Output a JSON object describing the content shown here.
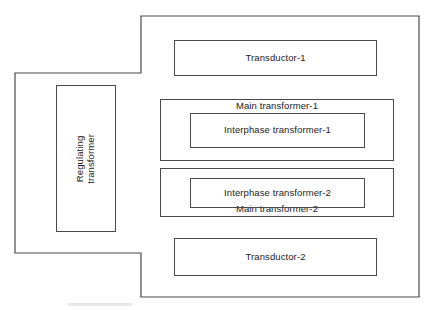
{
  "diagram": {
    "type": "block-diagram",
    "background_color": "#ffffff",
    "line_color": "#4a4a4a",
    "text_color": "#1a1a1a",
    "enclosure": {
      "name": "outer-enclosure",
      "shape": "stepped-polygon",
      "points": "141,16 419,16 419,297 141,297 141,253 15,253 15,73 141,73"
    },
    "blocks": [
      {
        "id": "regulating-transformer",
        "label": "Regulating\ntransformer",
        "orientation": "vertical",
        "rotation_deg": -90
      },
      {
        "id": "transductor-1",
        "label": "Transductor-1",
        "orientation": "horizontal"
      },
      {
        "id": "main-transformer-1",
        "label": "Main transformer-1",
        "orientation": "horizontal",
        "label_position": "top"
      },
      {
        "id": "interphase-transformer-1",
        "label": "Interphase transformer-1",
        "orientation": "horizontal",
        "parent": "main-transformer-1"
      },
      {
        "id": "main-transformer-2",
        "label": "Main transformer-2",
        "orientation": "horizontal",
        "label_position": "bottom"
      },
      {
        "id": "interphase-transformer-2",
        "label": "Interphase transformer-2",
        "orientation": "horizontal",
        "parent": "main-transformer-2"
      },
      {
        "id": "transductor-2",
        "label": "Transductor-2",
        "orientation": "horizontal"
      }
    ]
  },
  "labels": {
    "regulating_transformer_line1": "Regulating",
    "regulating_transformer_line2": "transformer",
    "transductor_1": "Transductor-1",
    "main_transformer_1": "Main transformer-1",
    "interphase_transformer_1": "Interphase transformer-1",
    "main_transformer_2": "Main transformer-2",
    "interphase_transformer_2": "Interphase transformer-2",
    "transductor_2": "Transductor-2"
  }
}
